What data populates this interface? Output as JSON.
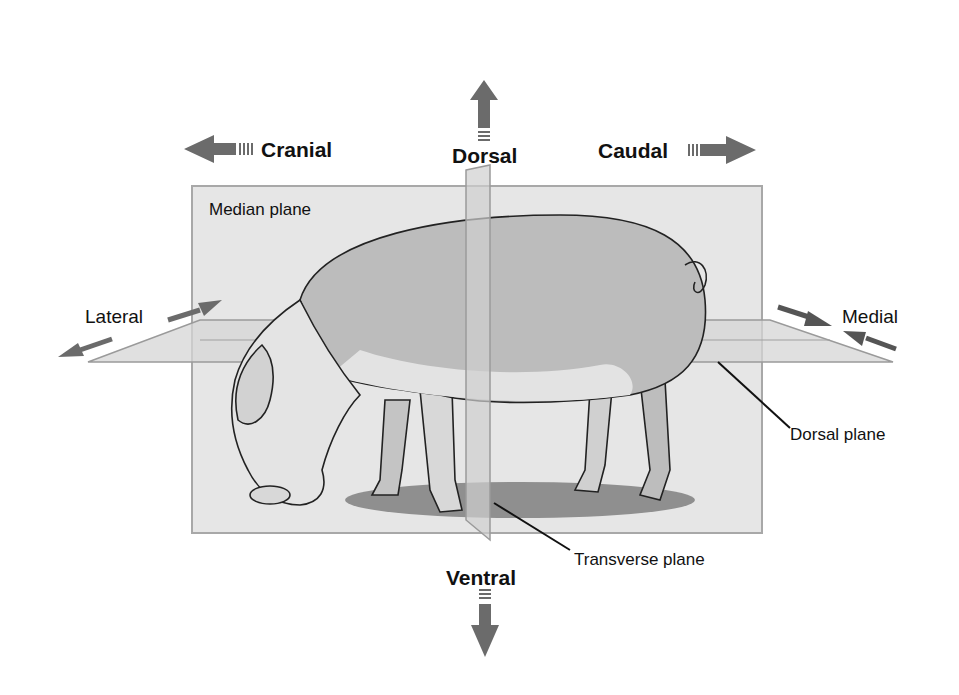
{
  "diagram": {
    "directions": {
      "dorsal": "Dorsal",
      "ventral": "Ventral",
      "cranial": "Cranial",
      "caudal": "Caudal",
      "lateral": "Lateral",
      "medial": "Medial"
    },
    "planes": {
      "median": "Median plane",
      "dorsal": "Dorsal plane",
      "transverse": "Transverse plane"
    },
    "colors": {
      "arrow": "#6b6b6b",
      "plane_fill": "#e4e4e4",
      "plane_border": "#a8a8a8",
      "pig_body": "#b9b9b9",
      "pig_light": "#e6e6e6",
      "shadow": "#8a8a8a",
      "text": "#111111"
    }
  }
}
